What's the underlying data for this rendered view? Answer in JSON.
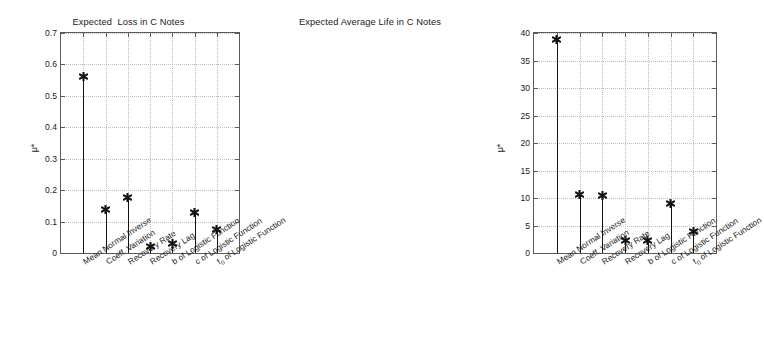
{
  "figure": {
    "width": 485,
    "height": 356,
    "background": "#ffffff",
    "axis_color": "#5a5a5a",
    "grid_color": "#bdbdbd",
    "marker_color": "#141414"
  },
  "chart_data": [
    {
      "type": "bar",
      "style": "stem",
      "panel": "left",
      "title": "Expected  Loss in C Notes",
      "xlabel": "",
      "ylabel": "μ*",
      "ylim": [
        0,
        0.7
      ],
      "yticks": [
        0,
        0.1,
        0.2,
        0.3,
        0.4,
        0.5,
        0.6,
        0.7
      ],
      "ytick_labels": [
        "0",
        "0.1",
        "0.2",
        "0.3",
        "0.4",
        "0.5",
        "0.6",
        "0.7"
      ],
      "grid": true,
      "legend": "none",
      "categories": [
        "Mean Normal Inverse",
        "Coeff. Variation",
        "Recovery Rate",
        "Recovery Lag",
        "b of Logistic Function",
        "c of Logistic Function",
        "f₀ of Logistic Function"
      ],
      "values": [
        0.562,
        0.138,
        0.178,
        0.022,
        0.031,
        0.13,
        0.074
      ]
    },
    {
      "type": "bar",
      "style": "stem",
      "panel": "right",
      "title": "Expected Average Life in C Notes",
      "xlabel": "",
      "ylabel": "μ*",
      "ylim": [
        0,
        40
      ],
      "yticks": [
        0,
        5,
        10,
        15,
        20,
        25,
        30,
        35,
        40
      ],
      "ytick_labels": [
        "0",
        "5",
        "10",
        "15",
        "20",
        "25",
        "30",
        "35",
        "40"
      ],
      "grid": true,
      "legend": "none",
      "categories": [
        "Mean Normal Inverse",
        "Coeff. Variation",
        "Recovery Rate",
        "Recovery Lag",
        "b of Logistic Function",
        "c of Logistic Function",
        "f₀ of Logistic Function"
      ],
      "values": [
        38.8,
        10.7,
        10.4,
        2.3,
        2.2,
        9.0,
        4.0
      ]
    }
  ]
}
